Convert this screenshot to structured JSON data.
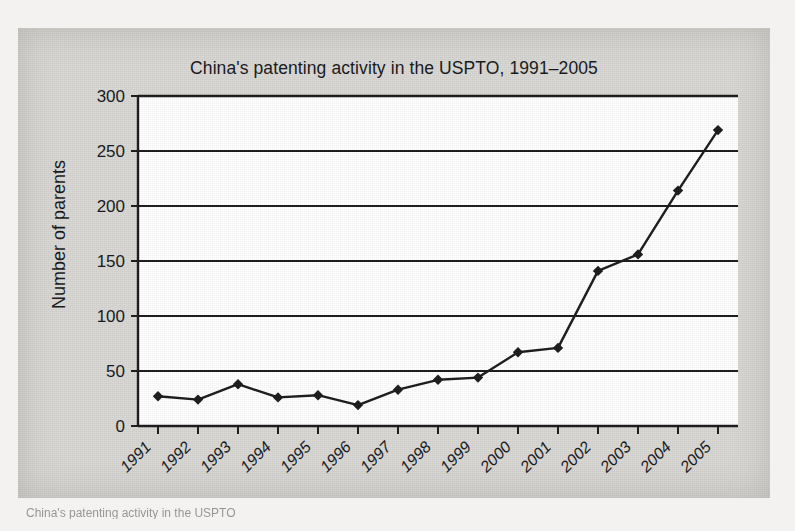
{
  "figure": {
    "caption_fragment": "China's patenting activity in the USPTO"
  },
  "chart_data": {
    "type": "line",
    "title": "China's patenting activity in the USPTO, 1991–2005",
    "xlabel": "",
    "ylabel": "Number of parents",
    "categories": [
      "1991",
      "1992",
      "1993",
      "1994",
      "1995",
      "1996",
      "1997",
      "1998",
      "1999",
      "2000",
      "2001",
      "2002",
      "2003",
      "2004",
      "2005"
    ],
    "values": [
      27,
      24,
      38,
      26,
      28,
      19,
      33,
      42,
      44,
      67,
      71,
      141,
      156,
      214,
      269
    ],
    "ylim": [
      0,
      300
    ],
    "yticks": [
      0,
      50,
      100,
      150,
      200,
      250,
      300
    ],
    "ytick_labels": [
      "0",
      "50",
      "100",
      "150",
      "200",
      "250",
      "300"
    ],
    "grid": "horizontal",
    "legend": "none",
    "marker": "diamond",
    "line_color": "#1a1a1a",
    "marker_color": "#1a1a1a",
    "plot_background": "#ffffff",
    "page_background": "#d8d7d3"
  }
}
